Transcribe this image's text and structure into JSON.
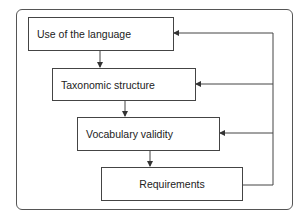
{
  "diagram": {
    "nodes": [
      {
        "id": "use",
        "label": "Use of the language"
      },
      {
        "id": "taxonomic",
        "label": "Taxonomic structure"
      },
      {
        "id": "vocabulary",
        "label": "Vocabulary validity"
      },
      {
        "id": "requirements",
        "label": "Requirements"
      }
    ],
    "edges": [
      {
        "from": "use",
        "to": "taxonomic"
      },
      {
        "from": "taxonomic",
        "to": "vocabulary"
      },
      {
        "from": "vocabulary",
        "to": "requirements"
      },
      {
        "from": "requirements",
        "to": "use",
        "type": "feedback"
      },
      {
        "from": "requirements",
        "to": "taxonomic",
        "type": "feedback"
      },
      {
        "from": "requirements",
        "to": "vocabulary",
        "type": "feedback"
      }
    ]
  }
}
